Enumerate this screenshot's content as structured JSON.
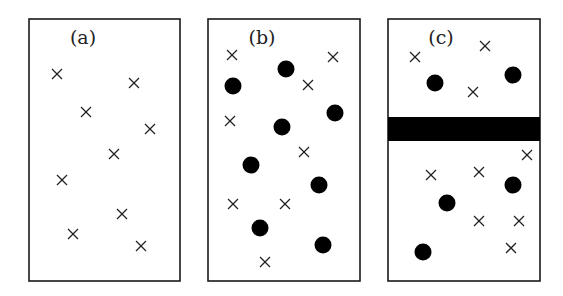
{
  "figure": {
    "panels": [
      {
        "label": "(a)",
        "box": [
          29,
          19,
          151,
          262
        ],
        "label_pos": [
          83,
          44
        ],
        "barrier": null,
        "crosses": [
          [
            57,
            74
          ],
          [
            134,
            83
          ],
          [
            86,
            112
          ],
          [
            150,
            129
          ],
          [
            114,
            154
          ],
          [
            62,
            180
          ],
          [
            122,
            214
          ],
          [
            73,
            234
          ],
          [
            141,
            246
          ]
        ],
        "dots": []
      },
      {
        "label": "(b)",
        "box": [
          208,
          19,
          152,
          262
        ],
        "label_pos": [
          262,
          44
        ],
        "barrier": null,
        "crosses": [
          [
            232,
            55
          ],
          [
            333,
            57
          ],
          [
            308,
            85
          ],
          [
            230,
            121
          ],
          [
            304,
            152
          ],
          [
            233,
            204
          ],
          [
            285,
            204
          ],
          [
            265,
            262
          ]
        ],
        "dots": [
          [
            286,
            69
          ],
          [
            233,
            86
          ],
          [
            335,
            113
          ],
          [
            282,
            127
          ],
          [
            251,
            165
          ],
          [
            319,
            185
          ],
          [
            260,
            228
          ],
          [
            323,
            245
          ]
        ]
      },
      {
        "label": "(c)",
        "box": [
          388,
          19,
          152,
          262
        ],
        "label_pos": [
          441,
          44
        ],
        "barrier": [
          388,
          117,
          152,
          24
        ],
        "crosses": [
          [
            415,
            57
          ],
          [
            485,
            46
          ],
          [
            473,
            92
          ],
          [
            527,
            155
          ],
          [
            431,
            175
          ],
          [
            479,
            172
          ],
          [
            479,
            221
          ],
          [
            519,
            221
          ],
          [
            511,
            248
          ]
        ],
        "dots": [
          [
            435,
            83
          ],
          [
            513,
            75
          ],
          [
            513,
            185
          ],
          [
            447,
            203
          ],
          [
            423,
            252
          ]
        ]
      }
    ],
    "colors": {
      "stroke": "#1a1a1a",
      "fill": "#000000",
      "cross": "#222222"
    }
  }
}
